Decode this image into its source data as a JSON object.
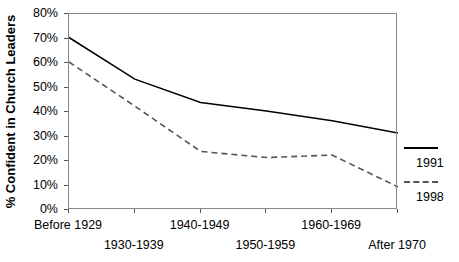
{
  "chart_data": {
    "type": "line",
    "title": "",
    "xlabel": "",
    "ylabel": "% Confident in Church Leaders",
    "categories": [
      "Before 1929",
      "1930-1939",
      "1940-1949",
      "1950-1959",
      "1960-1969",
      "After 1970"
    ],
    "ylim": [
      0,
      80
    ],
    "ytick_labels": [
      "0%",
      "10%",
      "20%",
      "30%",
      "40%",
      "50%",
      "60%",
      "70%",
      "80%"
    ],
    "ytick_values": [
      0,
      10,
      20,
      30,
      40,
      50,
      60,
      70,
      80
    ],
    "grid": false,
    "legend_position": "right-outside",
    "series": [
      {
        "name": "1991",
        "style": "solid",
        "color": "#000000",
        "values": [
          70,
          53,
          43.5,
          40,
          36,
          31
        ]
      },
      {
        "name": "1998",
        "style": "dashed",
        "color": "#555555",
        "values": [
          60,
          42,
          23.5,
          21,
          22,
          9
        ]
      }
    ]
  },
  "legend": {
    "items": [
      {
        "label": "1991",
        "style": "solid"
      },
      {
        "label": "1998",
        "style": "dashed"
      }
    ]
  }
}
